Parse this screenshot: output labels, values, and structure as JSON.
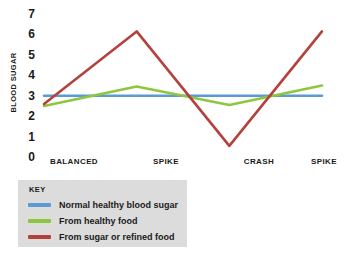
{
  "chart_data": {
    "type": "line",
    "title": "",
    "xlabel": "",
    "ylabel": "BLOOD SUGAR",
    "categories": [
      "BALANCED",
      "SPIKE",
      "CRASH",
      "SPIKE"
    ],
    "x": [
      0,
      1,
      2,
      3
    ],
    "ylim": [
      0,
      7
    ],
    "xlim": [
      0,
      3
    ],
    "yticks": [
      7,
      6,
      5,
      4,
      3,
      2,
      1,
      0
    ],
    "grid": false,
    "legend_position": "bottom-left",
    "series": [
      {
        "name": "Normal healthy blood sugar",
        "color": "#5b9bd5",
        "values": [
          2.9,
          2.9,
          2.9,
          2.9
        ]
      },
      {
        "name": "From healthy food",
        "color": "#8dc63f",
        "values": [
          2.4,
          3.35,
          2.45,
          3.4
        ]
      },
      {
        "name": "From sugar or refined food",
        "color": "#b5413c",
        "values": [
          2.5,
          6.05,
          0.45,
          6.05
        ]
      }
    ]
  },
  "axis": {
    "y_title": "BLOOD SUGAR",
    "y_ticks": [
      "7",
      "6",
      "5",
      "4",
      "3",
      "2",
      "1",
      "0"
    ],
    "x_ticks": [
      "BALANCED",
      "SPIKE",
      "CRASH",
      "SPIKE"
    ]
  },
  "legend": {
    "title": "KEY",
    "items": [
      {
        "label": "Normal healthy blood sugar",
        "color": "#5b9bd5"
      },
      {
        "label": "From healthy food",
        "color": "#8dc63f"
      },
      {
        "label": "From sugar or refined food",
        "color": "#b5413c"
      }
    ]
  },
  "colors": {
    "background": "#ffffff",
    "legend_background": "#dcdcdc",
    "text": "#1a1a1a",
    "blue": "#5b9bd5",
    "green": "#8dc63f",
    "red": "#b5413c"
  }
}
